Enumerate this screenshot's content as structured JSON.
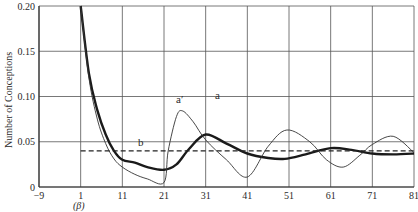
{
  "chart_data": {
    "type": "line",
    "title": "",
    "xlabel": "",
    "xlabel_note": "(β)",
    "ylabel": "Number of Conceptions",
    "xlim": [
      -9,
      81
    ],
    "ylim": [
      0,
      0.2
    ],
    "grid": true,
    "x_ticks": [
      "-9",
      "1",
      "11",
      "21",
      "31",
      "41",
      "51",
      "61",
      "71",
      "81"
    ],
    "y_ticks": [
      "0",
      "0.05",
      "0.10",
      "0.15",
      "0.20"
    ],
    "series": [
      {
        "name": "a",
        "style": "thick solid",
        "x": [
          1,
          3,
          5,
          7,
          9,
          11,
          14,
          17,
          21,
          24,
          27,
          31,
          36,
          41,
          46,
          50,
          55,
          61,
          66,
          71,
          76,
          81
        ],
        "values": [
          0.2,
          0.125,
          0.085,
          0.058,
          0.04,
          0.03,
          0.027,
          0.022,
          0.019,
          0.025,
          0.042,
          0.058,
          0.048,
          0.037,
          0.032,
          0.031,
          0.036,
          0.043,
          0.041,
          0.037,
          0.036,
          0.037
        ]
      },
      {
        "name": "a′",
        "style": "thin solid",
        "x": [
          1,
          3,
          5,
          7,
          9,
          11,
          14,
          17,
          21,
          22,
          24,
          25.5,
          28,
          31,
          36,
          41,
          46,
          50.5,
          56,
          60,
          64,
          68,
          71,
          76,
          81
        ],
        "values": [
          0.2,
          0.12,
          0.075,
          0.048,
          0.031,
          0.022,
          0.014,
          0.009,
          0.005,
          0.04,
          0.078,
          0.084,
          0.072,
          0.052,
          0.03,
          0.011,
          0.045,
          0.063,
          0.05,
          0.03,
          0.022,
          0.035,
          0.047,
          0.056,
          0.038
        ]
      },
      {
        "name": "b",
        "style": "dashed",
        "x": [
          1,
          81
        ],
        "values": [
          0.04,
          0.04
        ]
      }
    ],
    "annotations": [
      {
        "text": "a′",
        "x": 25.5,
        "y": 0.093
      },
      {
        "text": "a",
        "x": 34.5,
        "y": 0.098
      },
      {
        "text": "b",
        "x": 16,
        "y": 0.05
      }
    ]
  },
  "labels": {
    "a": "a",
    "a_prime": "a′",
    "b": "b",
    "beta": "(β)",
    "ylabel": "Number of Conceptions"
  }
}
